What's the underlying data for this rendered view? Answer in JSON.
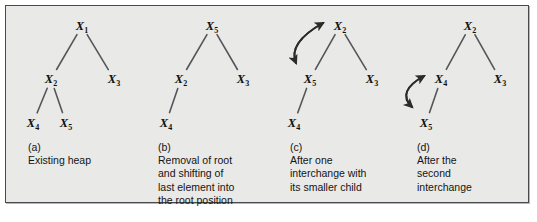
{
  "figure": {
    "background_color": "#e9e9e7",
    "border_color": "#4a4a4a",
    "edge_color": "#55565a",
    "arrow_color": "#2b2b2b",
    "text_color": "#141414"
  },
  "panels": [
    {
      "id": "a",
      "tag": "(a)",
      "caption_lines": [
        "Existing heap"
      ],
      "nodes": [
        {
          "name": "X1",
          "base": "X",
          "sub": "1",
          "x": 82,
          "y": 26
        },
        {
          "name": "X2",
          "base": "X",
          "sub": "2",
          "x": 51,
          "y": 79
        },
        {
          "name": "X3",
          "base": "X",
          "sub": "3",
          "x": 114,
          "y": 79
        },
        {
          "name": "X4",
          "base": "X",
          "sub": "4",
          "x": 33,
          "y": 123
        },
        {
          "name": "X5",
          "base": "X",
          "sub": "5",
          "x": 66,
          "y": 123
        }
      ],
      "edges": [
        {
          "from": "X1",
          "to": "X2"
        },
        {
          "from": "X1",
          "to": "X3"
        },
        {
          "from": "X2",
          "to": "X4"
        },
        {
          "from": "X2",
          "to": "X5"
        }
      ],
      "swap_arrow": null
    },
    {
      "id": "b",
      "tag": "(b)",
      "caption_lines": [
        "Removal of root",
        "and shifting of",
        "last element into",
        "the root position"
      ],
      "nodes": [
        {
          "name": "X5",
          "base": "X",
          "sub": "5",
          "x": 212,
          "y": 26
        },
        {
          "name": "X2",
          "base": "X",
          "sub": "2",
          "x": 181,
          "y": 79
        },
        {
          "name": "X3",
          "base": "X",
          "sub": "3",
          "x": 243,
          "y": 79
        },
        {
          "name": "X4",
          "base": "X",
          "sub": "4",
          "x": 166,
          "y": 123
        }
      ],
      "edges": [
        {
          "from": "X5",
          "to": "X2"
        },
        {
          "from": "X5",
          "to": "X3"
        },
        {
          "from": "X2",
          "to": "X4"
        }
      ],
      "swap_arrow": null
    },
    {
      "id": "c",
      "tag": "(c)",
      "caption_lines": [
        "After one",
        "interchange with",
        "its smaller child"
      ],
      "nodes": [
        {
          "name": "X2",
          "base": "X",
          "sub": "2",
          "x": 340,
          "y": 26
        },
        {
          "name": "X5",
          "base": "X",
          "sub": "5",
          "x": 310,
          "y": 79
        },
        {
          "name": "X3",
          "base": "X",
          "sub": "3",
          "x": 372,
          "y": 79
        },
        {
          "name": "X4",
          "base": "X",
          "sub": "4",
          "x": 294,
          "y": 123
        }
      ],
      "edges": [
        {
          "from": "X2",
          "to": "X5"
        },
        {
          "from": "X2",
          "to": "X3"
        },
        {
          "from": "X5",
          "to": "X4"
        }
      ],
      "swap_arrow": {
        "between": [
          "X5",
          "X2"
        ],
        "double_headed": true
      }
    },
    {
      "id": "d",
      "tag": "(d)",
      "caption_lines": [
        "After the",
        "second",
        "interchange"
      ],
      "nodes": [
        {
          "name": "X2",
          "base": "X",
          "sub": "2",
          "x": 470,
          "y": 26
        },
        {
          "name": "X4",
          "base": "X",
          "sub": "4",
          "x": 441,
          "y": 79
        },
        {
          "name": "X3",
          "base": "X",
          "sub": "3",
          "x": 500,
          "y": 79
        },
        {
          "name": "X5",
          "base": "X",
          "sub": "5",
          "x": 426,
          "y": 123
        }
      ],
      "edges": [
        {
          "from": "X2",
          "to": "X4"
        },
        {
          "from": "X2",
          "to": "X3"
        },
        {
          "from": "X4",
          "to": "X5"
        }
      ],
      "swap_arrow": {
        "between": [
          "X5",
          "X4"
        ],
        "double_headed": true
      }
    }
  ],
  "caption_positions": [
    {
      "id": "a",
      "left": 28,
      "top": 141
    },
    {
      "id": "b",
      "left": 158,
      "top": 141
    },
    {
      "id": "c",
      "left": 290,
      "top": 141
    },
    {
      "id": "d",
      "left": 417,
      "top": 141
    }
  ]
}
